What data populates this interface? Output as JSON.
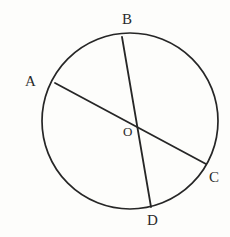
{
  "figure": {
    "kind": "circle-geometry-diagram",
    "canvas": {
      "width": 230,
      "height": 237
    },
    "background_color": "#fdfdfb",
    "stroke_color": "#262626",
    "circle": {
      "name": "circle-outline",
      "center_x": 130,
      "center_y": 121,
      "radius": 88,
      "stroke_width": 1.7
    },
    "center_point": {
      "label": "O",
      "x": 130,
      "y": 121,
      "label_x": 123,
      "label_y": 125
    },
    "points": [
      {
        "id": "A",
        "label": "A",
        "x": 55,
        "y": 83,
        "label_x": 25,
        "label_y": 74
      },
      {
        "id": "B",
        "label": "B",
        "x": 122,
        "y": 37,
        "label_x": 122,
        "label_y": 12
      },
      {
        "id": "C",
        "label": "C",
        "x": 206,
        "y": 164,
        "label_x": 209,
        "label_y": 170
      },
      {
        "id": "D",
        "label": "D",
        "x": 151,
        "y": 207,
        "label_x": 147,
        "label_y": 213
      }
    ],
    "chords": [
      {
        "id": "AC",
        "from": "A",
        "to": "C",
        "x1": 55,
        "y1": 83,
        "x2": 206,
        "y2": 164,
        "stroke_width": 1.8
      },
      {
        "id": "BD",
        "from": "B",
        "to": "D",
        "x1": 122,
        "y1": 37,
        "x2": 151,
        "y2": 207,
        "stroke_width": 1.8
      }
    ]
  }
}
